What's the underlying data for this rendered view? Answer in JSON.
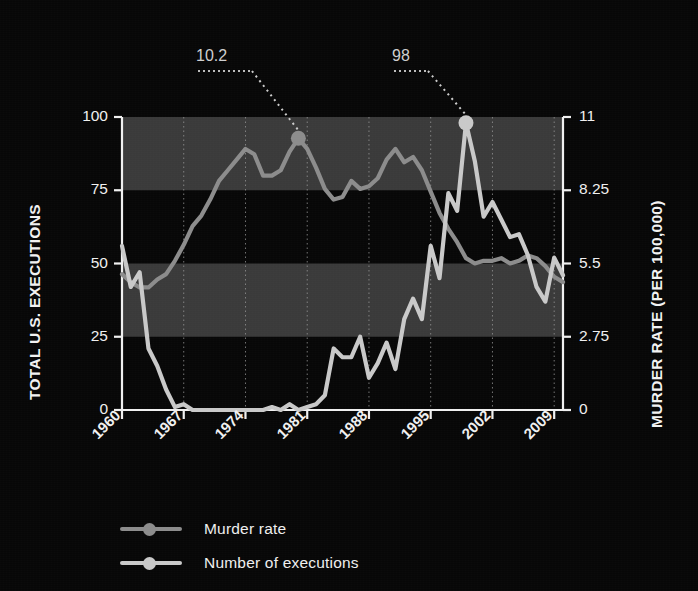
{
  "chart_data": {
    "type": "line",
    "title": "",
    "xlabel": "",
    "ylabel": "TOTAL U.S. EXECUTIONS",
    "y2label": "MURDER RATE (PER 100,000)",
    "grid": true,
    "legend_position": "bottom-left",
    "xlim": [
      1960,
      2010
    ],
    "ylim": [
      0,
      100
    ],
    "y2lim": [
      0,
      11
    ],
    "xticks": [
      1960,
      1967,
      1974,
      1981,
      1988,
      1995,
      2002,
      2009
    ],
    "xtick_labels": [
      "1960",
      "1967",
      "1974",
      "1981",
      "1988",
      "1995",
      "2002",
      "2009"
    ],
    "yticks": [
      0,
      25,
      50,
      75,
      100
    ],
    "ytick_labels": [
      "0",
      "25",
      "50",
      "75",
      "100"
    ],
    "y2ticks": [
      0,
      2.75,
      5.5,
      8.25,
      11
    ],
    "y2tick_labels": [
      "0",
      "2.75",
      "5.5",
      "8.25",
      "11"
    ],
    "band_color": "#3a3a3a",
    "bands": [
      [
        75,
        100
      ],
      [
        25,
        50
      ]
    ],
    "x": [
      1960,
      1961,
      1962,
      1963,
      1964,
      1965,
      1966,
      1967,
      1968,
      1969,
      1970,
      1971,
      1972,
      1973,
      1974,
      1975,
      1976,
      1977,
      1978,
      1979,
      1980,
      1981,
      1982,
      1983,
      1984,
      1985,
      1986,
      1987,
      1988,
      1989,
      1990,
      1991,
      1992,
      1993,
      1994,
      1995,
      1996,
      1997,
      1998,
      1999,
      2000,
      2001,
      2002,
      2003,
      2004,
      2005,
      2006,
      2007,
      2008,
      2009,
      2010
    ],
    "series": [
      {
        "name": "Murder rate",
        "axis": "right",
        "color": "#8c8c8c",
        "units": "per 100,000",
        "values": [
          5.1,
          4.8,
          4.6,
          4.6,
          4.9,
          5.1,
          5.6,
          6.2,
          6.9,
          7.3,
          7.9,
          8.6,
          9.0,
          9.4,
          9.8,
          9.6,
          8.8,
          8.8,
          9.0,
          9.7,
          10.2,
          9.8,
          9.1,
          8.3,
          7.9,
          8.0,
          8.6,
          8.3,
          8.4,
          8.7,
          9.4,
          9.8,
          9.3,
          9.5,
          9.0,
          8.2,
          7.4,
          6.8,
          6.3,
          5.7,
          5.5,
          5.6,
          5.6,
          5.7,
          5.5,
          5.6,
          5.8,
          5.7,
          5.4,
          5.0,
          4.8
        ],
        "annotation": {
          "label": "10.2",
          "x": 1980,
          "y": 10.2
        }
      },
      {
        "name": "Number of executions",
        "axis": "left",
        "color": "#c9c9c9",
        "units": "executions",
        "values": [
          56,
          42,
          47,
          21,
          15,
          7,
          1,
          2,
          0,
          0,
          0,
          0,
          0,
          0,
          0,
          0,
          0,
          1,
          0,
          2,
          0,
          1,
          2,
          5,
          21,
          18,
          18,
          25,
          11,
          16,
          23,
          14,
          31,
          38,
          31,
          56,
          45,
          74,
          68,
          98,
          85,
          66,
          71,
          65,
          59,
          60,
          53,
          42,
          37,
          52,
          46
        ],
        "annotation": {
          "label": "98",
          "x": 1999,
          "y": 98
        }
      }
    ]
  },
  "annotations": [
    {
      "name": "murder-rate-peak-callout",
      "label": "10.2"
    },
    {
      "name": "executions-peak-callout",
      "label": "98"
    }
  ],
  "legend": {
    "items": [
      {
        "label": "Murder rate",
        "color": "#8c8c8c"
      },
      {
        "label": "Number of executions",
        "color": "#c9c9c9"
      }
    ]
  }
}
